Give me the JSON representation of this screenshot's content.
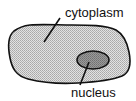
{
  "diagram": {
    "labels": {
      "cytoplasm": "cytoplasm",
      "nucleus": "nucleus"
    },
    "colors": {
      "cell_fill": "#c8c8c8",
      "nucleus_fill": "#8e8e8e",
      "outline": "#111111"
    }
  }
}
